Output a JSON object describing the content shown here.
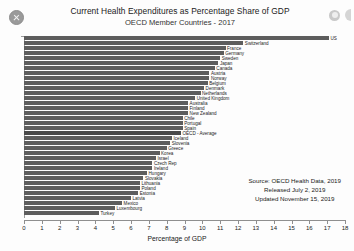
{
  "window": {
    "close_icon": "close-icon",
    "header_icons": [
      "info-circle-icon",
      "panel-edge-icon"
    ]
  },
  "header": {
    "title": "Current Health Expenditures as Percentage Share of GDP",
    "subtitle": "OECD Member Countries - 2017"
  },
  "source_note": {
    "line1": "Source:  OECD Health Data, 2019",
    "line2": "Released July 2, 2019",
    "line3": "Updated November 15, 2019"
  },
  "chart_data": {
    "type": "bar",
    "orientation": "horizontal",
    "title": "Current Health Expenditures as Percentage Share of GDP",
    "subtitle": "OECD Member Countries - 2017",
    "xlabel": "Percentage of GDP",
    "ylabel": "",
    "xlim": [
      0,
      18
    ],
    "xticks": [
      0,
      1,
      2,
      3,
      4,
      5,
      6,
      7,
      8,
      9,
      10,
      11,
      12,
      13,
      14,
      15,
      16,
      17,
      18
    ],
    "grid": false,
    "legend": false,
    "bar_color": "#5d5d5d",
    "highlight_color": "#4a4a4a",
    "categories": [
      "US",
      "Switzerland",
      "France",
      "Germany",
      "Sweden",
      "Japan",
      "Canada",
      "Austria",
      "Norway",
      "Belgium",
      "Denmark",
      "Netherlands",
      "United Kingdom",
      "Australia",
      "Finland",
      "New Zealand",
      "Chile",
      "Portugal",
      "Spain",
      "OECD - Average",
      "Iceland",
      "Slovenia",
      "Greece",
      "Korea",
      "Israel",
      "Czech Rep",
      "Ireland",
      "Hungary",
      "Slovakia",
      "Lithuania",
      "Poland",
      "Estonia",
      "Latvia",
      "Mexico",
      "Luxembourg",
      "Turkey"
    ],
    "values": [
      17.1,
      12.3,
      11.3,
      11.2,
      11.0,
      10.9,
      10.7,
      10.4,
      10.4,
      10.3,
      10.1,
      9.9,
      9.6,
      9.2,
      9.2,
      9.2,
      8.9,
      8.9,
      8.9,
      8.8,
      8.3,
      8.2,
      8.0,
      7.6,
      7.4,
      7.2,
      7.2,
      6.9,
      6.7,
      6.5,
      6.5,
      6.4,
      6.0,
      5.5,
      5.1,
      4.2
    ],
    "highlight_category": "OECD - Average"
  }
}
